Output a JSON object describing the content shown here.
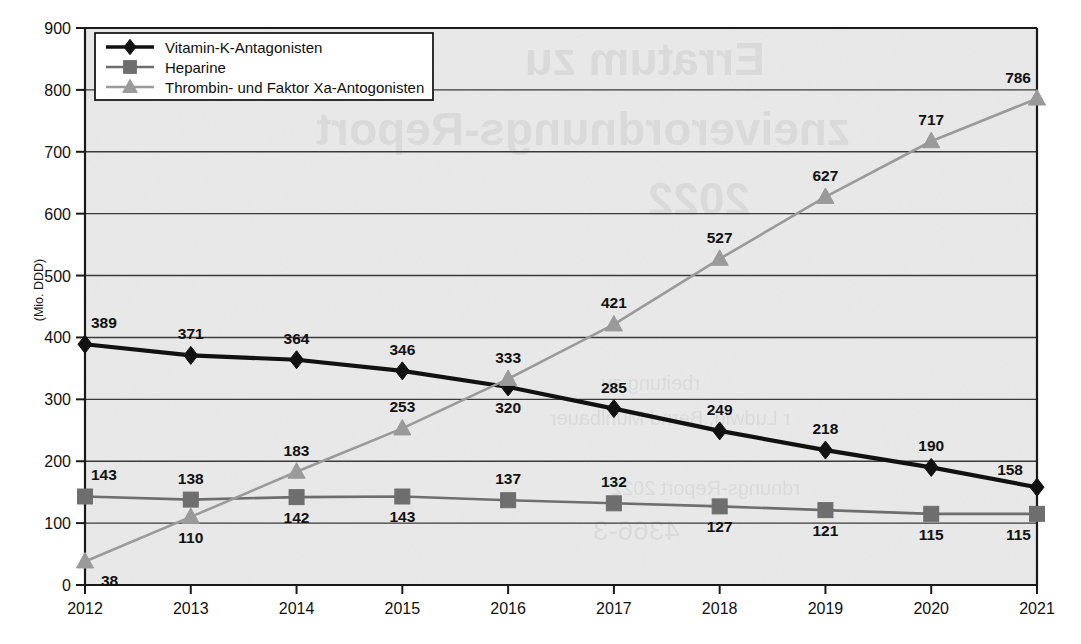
{
  "chart_data": {
    "type": "line",
    "title": "",
    "xlabel": "",
    "ylabel": "(Mio. DDD)",
    "categories": [
      "2012",
      "2013",
      "2014",
      "2015",
      "2016",
      "2017",
      "2018",
      "2019",
      "2020",
      "2021"
    ],
    "x": [
      2012,
      2013,
      2014,
      2015,
      2016,
      2017,
      2018,
      2019,
      2020,
      2021
    ],
    "ylim": [
      0,
      900
    ],
    "yticks": [
      0,
      100,
      200,
      300,
      400,
      500,
      600,
      700,
      800,
      900
    ],
    "ytick_labels": [
      "0",
      "100",
      "200",
      "300",
      "400",
      "500",
      "600",
      "700",
      "800",
      "900"
    ],
    "grid": "horizontal",
    "legend_position": "top-left",
    "series": [
      {
        "name": "Vitamin-K-Antagonisten",
        "marker": "diamond",
        "color": "#111111",
        "values": [
          389,
          371,
          364,
          346,
          320,
          285,
          249,
          218,
          190,
          158
        ],
        "labels": [
          "389",
          "371",
          "364",
          "346",
          "320",
          "285",
          "249",
          "218",
          "190",
          "158"
        ],
        "label_positions": [
          "above",
          "above",
          "above",
          "above",
          "below",
          "above",
          "above",
          "above",
          "above",
          "above-left"
        ]
      },
      {
        "name": "Heparine",
        "marker": "square",
        "color": "#6e6e6e",
        "values": [
          143,
          138,
          142,
          143,
          137,
          132,
          127,
          121,
          115,
          115
        ],
        "labels": [
          "143",
          "138",
          "142",
          "143",
          "137",
          "132",
          "127",
          "121",
          "115",
          "115"
        ],
        "label_positions": [
          "above",
          "above",
          "below",
          "below",
          "above",
          "above",
          "below",
          "below",
          "below",
          "below"
        ]
      },
      {
        "name": "Thrombin- und Faktor Xa-Antogonisten",
        "marker": "triangle",
        "color": "#9a9a9a",
        "values": [
          38,
          110,
          183,
          253,
          333,
          421,
          527,
          627,
          717,
          786
        ],
        "labels": [
          "38",
          "110",
          "183",
          "253",
          "333",
          "421",
          "527",
          "627",
          "717",
          "786"
        ],
        "label_positions": [
          "below-right",
          "below",
          "above",
          "above",
          "above",
          "above",
          "above",
          "above",
          "above",
          "above"
        ]
      }
    ]
  },
  "legend": {
    "items": [
      {
        "label": "Vitamin-K-Antagonisten",
        "marker": "diamond",
        "color": "#111111"
      },
      {
        "label": "Heparine",
        "marker": "square",
        "color": "#6e6e6e"
      },
      {
        "label": "Thrombin- und Faktor Xa-Antogonisten",
        "marker": "triangle",
        "color": "#9a9a9a"
      }
    ]
  },
  "axis": {
    "y_title": "(Mio. DDD)"
  },
  "colors": {
    "plot_background": "#e9e9e9",
    "grid": "#3a3a3a",
    "axis": "#1a1a1a",
    "series_black": "#111111",
    "series_gray": "#6e6e6e",
    "series_light_gray": "#9a9a9a"
  }
}
